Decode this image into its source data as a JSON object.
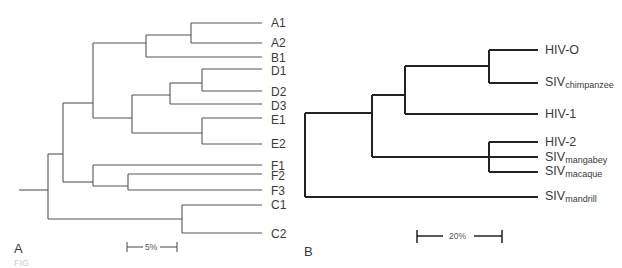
{
  "figure": {
    "panel_a": {
      "label": "A",
      "scale_bar": "5%",
      "leaves": [
        "A1",
        "A2",
        "B1",
        "D1",
        "D2",
        "D3",
        "E1",
        "E2",
        "F1",
        "F2",
        "F3",
        "C1",
        "C2"
      ]
    },
    "panel_b": {
      "label": "B",
      "scale_bar": "20%",
      "leaves": [
        {
          "base": "HIV-O",
          "sub": ""
        },
        {
          "base": "SIV",
          "sub": "chimpanzee"
        },
        {
          "base": "HIV-1",
          "sub": ""
        },
        {
          "base": "HIV-2",
          "sub": ""
        },
        {
          "base": "SIV",
          "sub": "mangabey"
        },
        {
          "base": "SIV",
          "sub": "macaque"
        },
        {
          "base": "SIV",
          "sub": "mandrill"
        }
      ]
    },
    "caption_fragment": "FIG"
  },
  "colors": {
    "tree_a_line": "#555555",
    "tree_b_line": "#222222",
    "text": "#3a3a3a"
  }
}
